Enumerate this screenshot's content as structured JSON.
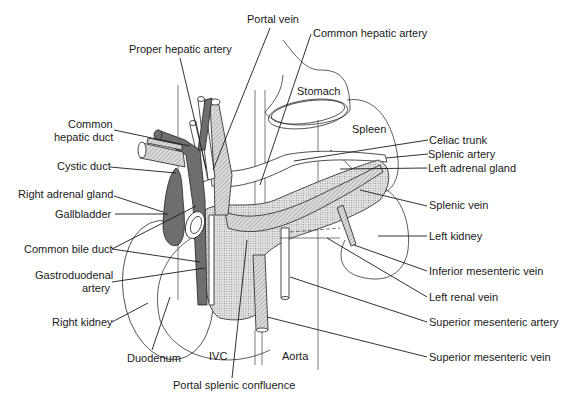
{
  "figure": {
    "labels": {
      "portal_vein": "Portal vein",
      "common_hepatic_artery": "Common hepatic artery",
      "proper_hepatic_artery": "Proper hepatic artery",
      "stomach": "Stomach",
      "spleen": "Spleen",
      "common_hepatic_duct_1": "Common",
      "common_hepatic_duct_2": "hepatic duct",
      "cystic_duct": "Cystic duct",
      "celiac_trunk": "Celiac trunk",
      "splenic_artery": "Splenic artery",
      "left_adrenal_gland": "Left adrenal gland",
      "right_adrenal_gland": "Right adrenal gland",
      "gallbladder": "Gallbladder",
      "splenic_vein": "Splenic vein",
      "common_bile_duct": "Common bile duct",
      "left_kidney": "Left kidney",
      "gastroduodenal_artery_1": "Gastroduodenal",
      "gastroduodenal_artery_2": "artery",
      "inferior_mesenteric_vein": "Inferior mesenteric vein",
      "left_renal_vein": "Left renal vein",
      "right_kidney": "Right kidney",
      "superior_mesenteric_artery": "Superior mesenteric artery",
      "duodenum": "Duodenum",
      "ivc": "IVC",
      "aorta": "Aorta",
      "superior_mesenteric_vein": "Superior mesenteric vein",
      "portal_splenic_confluence": "Portal splenic confluence"
    },
    "colors": {
      "line": "#1a1a1a",
      "shade_dark": "#6e6e6e",
      "background": "#ffffff"
    }
  }
}
